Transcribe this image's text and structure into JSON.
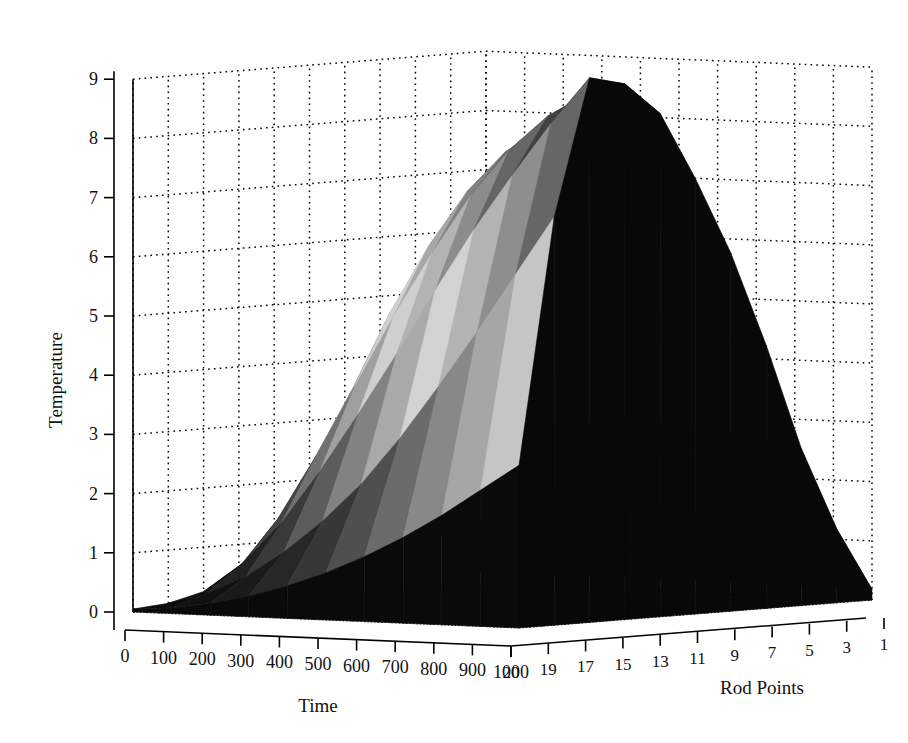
{
  "figure": {
    "kind": "3d-surface-plot",
    "background": "#ffffff",
    "ink": "#000000"
  },
  "chart_data": {
    "type": "surface",
    "title": "",
    "xlabel": "Time",
    "ylabel": "Rod Points",
    "zlabel": "Temperature",
    "grid": true,
    "legend": "none",
    "projection": "3d-isometric",
    "x": {
      "name": "Time",
      "ticks": [
        0,
        100,
        200,
        300,
        400,
        500,
        600,
        700,
        800,
        900,
        1000
      ],
      "tick_labels": [
        "0",
        "100",
        "200",
        "300",
        "400",
        "500",
        "600",
        "700",
        "800",
        "900",
        "1000"
      ],
      "range": [
        0,
        1000
      ]
    },
    "y": {
      "name": "Rod Points",
      "ticks": [
        20,
        19,
        17,
        15,
        13,
        11,
        9,
        7,
        5,
        3,
        1
      ],
      "tick_labels": [
        "20",
        "19",
        "17",
        "15",
        "13",
        "11",
        "9",
        "7",
        "5",
        "3",
        "1"
      ],
      "range": [
        20,
        1
      ],
      "direction": "descending"
    },
    "z": {
      "name": "Temperature",
      "ticks": [
        0,
        1,
        2,
        3,
        4,
        5,
        6,
        7,
        8,
        9
      ],
      "tick_labels": [
        "0",
        "1",
        "2",
        "3",
        "4",
        "5",
        "6",
        "7",
        "8",
        "9"
      ],
      "range": [
        0,
        9
      ],
      "peak_value": 9.2
    },
    "colormap": "grayscale",
    "nx": 11,
    "ny": 11,
    "values": [
      [
        0.05,
        0.1,
        0.25,
        0.55,
        1.05,
        1.7,
        2.35,
        2.2,
        1.45,
        0.7,
        0.1
      ],
      [
        0.1,
        0.3,
        0.75,
        1.45,
        2.25,
        3.0,
        3.4,
        2.95,
        1.95,
        0.95,
        0.15
      ],
      [
        0.2,
        0.6,
        1.45,
        2.55,
        3.6,
        4.35,
        4.45,
        3.7,
        2.4,
        1.15,
        0.18
      ],
      [
        0.35,
        1.05,
        2.35,
        3.75,
        4.95,
        5.55,
        5.35,
        4.3,
        2.75,
        1.3,
        0.2
      ],
      [
        0.55,
        1.6,
        3.35,
        4.95,
        6.1,
        6.45,
        5.95,
        4.7,
        2.95,
        1.4,
        0.22
      ],
      [
        0.8,
        2.25,
        4.4,
        6.05,
        7.05,
        7.05,
        6.3,
        4.9,
        3.05,
        1.45,
        0.22
      ],
      [
        1.1,
        3.05,
        5.5,
        7.05,
        7.75,
        7.45,
        6.5,
        4.95,
        3.05,
        1.45,
        0.22
      ],
      [
        1.45,
        3.95,
        6.55,
        7.85,
        8.2,
        7.6,
        6.5,
        4.9,
        3.0,
        1.42,
        0.21
      ],
      [
        1.85,
        4.9,
        7.5,
        8.45,
        8.45,
        7.6,
        6.4,
        4.8,
        2.9,
        1.38,
        0.2
      ],
      [
        2.3,
        5.9,
        8.4,
        8.85,
        8.55,
        7.5,
        6.25,
        4.65,
        2.8,
        1.32,
        0.19
      ],
      [
        2.75,
        6.9,
        9.2,
        9.05,
        8.5,
        7.35,
        6.05,
        4.45,
        2.65,
        1.25,
        0.18
      ]
    ]
  },
  "axes": {
    "z_title": "Temperature",
    "x_title": "Time",
    "y_title": "Rod Points"
  },
  "x_tick_labels": [
    "0",
    "100",
    "200",
    "300",
    "400",
    "500",
    "600",
    "700",
    "800",
    "900",
    "1000"
  ],
  "y_tick_labels": [
    "20",
    "19",
    "17",
    "15",
    "13",
    "11",
    "9",
    "7",
    "5",
    "3",
    "1"
  ],
  "z_tick_labels": [
    "9",
    "8",
    "7",
    "6",
    "5",
    "4",
    "3",
    "2",
    "1",
    "0"
  ]
}
